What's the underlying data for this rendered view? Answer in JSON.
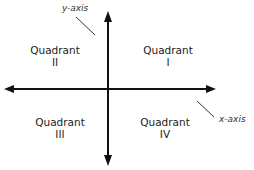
{
  "axes": {
    "y_label": "y-axis",
    "x_label": "x-axis"
  },
  "quadrants": [
    {
      "word": "Quadrant",
      "numeral": "I"
    },
    {
      "word": "Quadrant",
      "numeral": "II"
    },
    {
      "word": "Quadrant",
      "numeral": "III"
    },
    {
      "word": "Quadrant",
      "numeral": "IV"
    }
  ],
  "colors": {
    "line": "#111111",
    "text": "#222222"
  }
}
